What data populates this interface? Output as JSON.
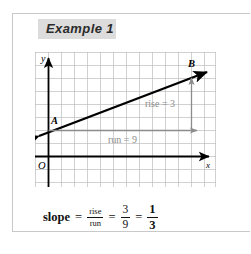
{
  "panel": {
    "heading": "Example 1"
  },
  "graph": {
    "axis_labels": {
      "y": "y",
      "x": "x",
      "origin": "O"
    },
    "points": [
      {
        "name": "A",
        "label": "A"
      },
      {
        "name": "B",
        "label": "B"
      }
    ],
    "annotations": {
      "rise": "rise = 3",
      "run": "run = 9"
    },
    "colors": {
      "grid": "#bdbdbd",
      "axis": "#000000",
      "line": "#000000",
      "annotation": "#8c8c8c",
      "heading_chip": "#dcdcdc"
    },
    "grid": {
      "columns": 13,
      "rows": 10,
      "cell_px": 13,
      "show_grid": true
    }
  },
  "formula": {
    "label": "slope",
    "equals_1": "=",
    "equals_2": "=",
    "equals_3": "=",
    "ratio_numerator": "rise",
    "ratio_denominator": "run",
    "values_numerator": "3",
    "values_denominator": "9",
    "result_numerator": "1",
    "result_denominator": "3"
  }
}
